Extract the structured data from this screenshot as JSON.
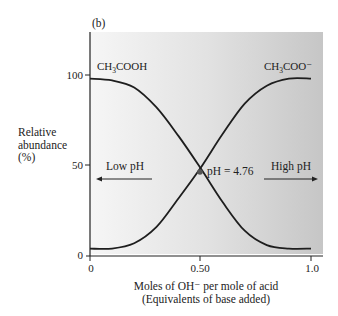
{
  "chart_data": {
    "type": "line",
    "panel_label": "(b)",
    "title": "",
    "xlabel": "Moles of OH⁻ per mole of acid",
    "xlabel_line2": "(Equivalents of base added)",
    "ylabel_lines": [
      "Relative",
      "abundance",
      "(%)"
    ],
    "xlim": [
      0,
      1.0
    ],
    "ylim": [
      0,
      100
    ],
    "x_ticks": [
      0,
      0.5,
      1.0
    ],
    "x_tick_labels": [
      "0",
      "0.50",
      "1.0"
    ],
    "y_ticks": [
      0,
      50,
      100
    ],
    "y_tick_labels": [
      "0",
      "50",
      "100"
    ],
    "grid": false,
    "background": "gradient light (left) to gray (right)",
    "x": [
      0,
      0.1,
      0.2,
      0.3,
      0.4,
      0.5,
      0.6,
      0.7,
      0.8,
      0.9,
      1.0
    ],
    "series": [
      {
        "name": "CH3COOH",
        "label_main": "CH",
        "label_sub": "3",
        "label_rest": "COOH",
        "values": [
          98,
          97,
          93,
          82,
          66,
          48,
          29,
          13,
          5,
          3,
          3
        ]
      },
      {
        "name": "CH3COO⁻",
        "label_main": "CH",
        "label_sub": "3",
        "label_rest": "COO⁻",
        "values": [
          3,
          3,
          6,
          15,
          31,
          48,
          67,
          84,
          94,
          98,
          98
        ]
      }
    ],
    "annotations": [
      {
        "text": "pH = 4.76",
        "x": 0.5,
        "y": 47,
        "marker": "dot"
      },
      {
        "text": "Low pH",
        "arrow": "left"
      },
      {
        "text": "High pH",
        "arrow": "right"
      }
    ]
  }
}
